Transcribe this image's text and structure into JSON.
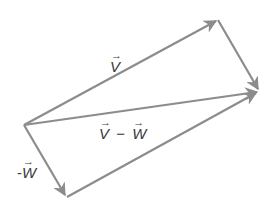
{
  "diagram": {
    "stroke_color": "#8c8c8c",
    "text_color": "#3a3a3a",
    "labels": {
      "v": "V",
      "v_minus_w_left": "V",
      "minus_sign": "−",
      "v_minus_w_right": "W",
      "neg_w_prefix": "-",
      "neg_w": "W",
      "vector_arrow": "→"
    },
    "vectors": [
      {
        "name": "v",
        "from": "origin",
        "to": "tip_v"
      },
      {
        "name": "neg-w",
        "from": "origin",
        "to": "tip_neg_w"
      },
      {
        "name": "v-minus-w",
        "from": "origin",
        "to": "tip_sum"
      },
      {
        "name": "neg-w-translated",
        "from": "tip_v",
        "to": "tip_sum"
      },
      {
        "name": "v-translated",
        "from": "tip_neg_w",
        "to": "tip_sum"
      }
    ]
  }
}
